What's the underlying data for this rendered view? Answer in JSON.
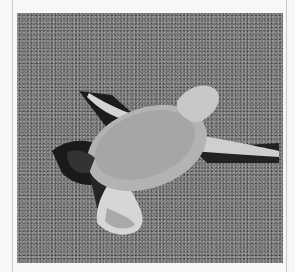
{
  "image": {
    "subject": "sea turtle hatchling crawling on sand",
    "alt": "Sea turtle hatchling on sand",
    "colors": {
      "page_background": "#f7f7f7",
      "frame_line": "#c9c9c9",
      "sand": "#7a7a7a",
      "shell": "#a9a9a9",
      "flipper": "#cfcfcf",
      "shadow": "#1e1e1e"
    }
  }
}
